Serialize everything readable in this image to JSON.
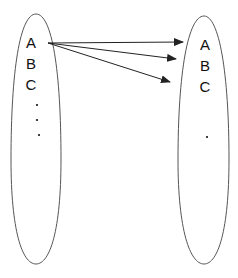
{
  "diagram": {
    "type": "mapping",
    "colors": {
      "stroke": "#555555",
      "text": "#111111",
      "arrow": "#222222",
      "background": "#ffffff"
    },
    "left_set": {
      "elements": [
        "A",
        "B",
        "C"
      ],
      "ellipsis": [
        "·",
        "·",
        "·"
      ]
    },
    "right_set": {
      "elements": [
        "A",
        "B",
        "C"
      ],
      "ellipsis": [
        "·"
      ]
    },
    "arrows": [
      {
        "from": "left.A",
        "to": "right.A"
      },
      {
        "from": "left.A",
        "to": "right.B"
      },
      {
        "from": "left.A",
        "to": "right.C"
      }
    ]
  }
}
